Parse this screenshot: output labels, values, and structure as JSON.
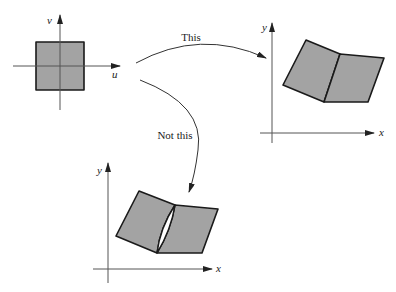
{
  "diagram": {
    "source_plot": {
      "axis_labels": {
        "horizontal": "u",
        "vertical": "v"
      }
    },
    "correct_mapping": {
      "arrow_label": "This",
      "axis_labels": {
        "horizontal": "x",
        "vertical": "y"
      }
    },
    "incorrect_mapping": {
      "arrow_label": "Not this",
      "axis_labels": {
        "horizontal": "x",
        "vertical": "y"
      }
    },
    "colors": {
      "fill": "#a3a3a3",
      "stroke": "#1a1a1a",
      "axis": "#555555"
    }
  }
}
